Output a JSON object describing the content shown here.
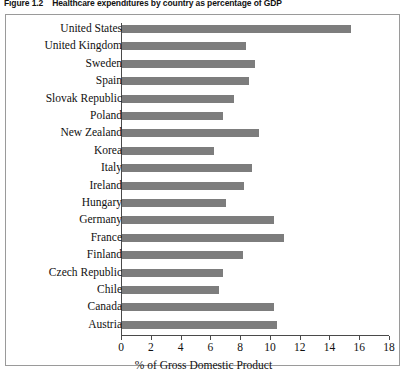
{
  "figure": {
    "number": "Figure 1.2",
    "caption": "Healthcare expenditures by country as percentage of GDP"
  },
  "colors": {
    "bar_fill": "#7d7d7d",
    "axis": "#4a4a4a",
    "frame_border": "#9a9a9a",
    "background": "#ffffff"
  },
  "chart_data": {
    "type": "bar",
    "orientation": "horizontal",
    "title": "Healthcare expenditures by country as percentage of GDP",
    "xlabel": "% of Gross Domestic Product",
    "ylabel": "",
    "xlim": [
      0,
      18
    ],
    "xticks": [
      0,
      2,
      4,
      6,
      8,
      10,
      12,
      14,
      16,
      18
    ],
    "grid": false,
    "legend": false,
    "categories": [
      "United States",
      "United Kingdom",
      "Sweden",
      "Spain",
      "Slovak Republic",
      "Poland",
      "New Zealand",
      "Korea",
      "Italy",
      "Ireland",
      "Hungary",
      "Germany",
      "France",
      "Finland",
      "Czech Republic",
      "Chile",
      "Canada",
      "Austria"
    ],
    "values": [
      15.4,
      8.3,
      8.9,
      8.5,
      7.5,
      6.8,
      9.2,
      6.2,
      8.7,
      8.2,
      7.0,
      10.2,
      10.9,
      8.1,
      6.8,
      6.5,
      10.2,
      10.4
    ]
  }
}
